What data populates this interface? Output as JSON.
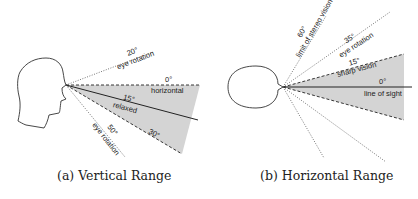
{
  "panels": [
    {
      "id": "a",
      "caption": "(a) Vertical Range",
      "labels": {
        "eye_rotation_up_angle": "20°",
        "eye_rotation_up_text": "eye rotation",
        "horizontal_angle": "0°",
        "horizontal_text": "horizontal",
        "relaxed_angle": "15°",
        "relaxed_text": "relaxed",
        "lower_limit_angle": "30°",
        "eye_rotation_down_angle": "50°",
        "eye_rotation_down_text": "eye rotation"
      }
    },
    {
      "id": "b",
      "caption": "(b) Horizontal Range",
      "labels": {
        "stereo_angle": "60°",
        "stereo_text": "limit of stereo vision",
        "eye_rotation_angle": "35°",
        "eye_rotation_text": "eye rotation",
        "sharp_angle": "15°",
        "sharp_text": "sharp vision",
        "sight_angle": "0°",
        "sight_text": "line of sight"
      }
    }
  ],
  "colors": {
    "shade": "#d4d4d4",
    "stroke": "#222222",
    "dotted": "#555555"
  }
}
